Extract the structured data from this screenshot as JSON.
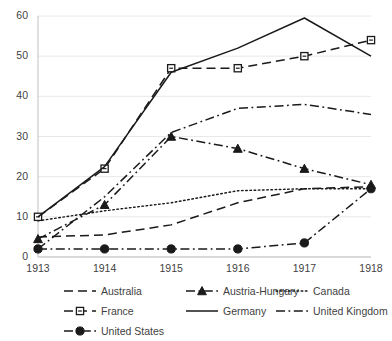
{
  "chart_data": {
    "type": "line",
    "title": "",
    "xlabel": "",
    "ylabel": "",
    "x": [
      1913,
      1914,
      1915,
      1916,
      1917,
      1918
    ],
    "xtick_labels": [
      "1913",
      "1914",
      "1915",
      "1916",
      "1917",
      "1918"
    ],
    "ytick_labels": [
      "0",
      "10",
      "20",
      "30",
      "40",
      "50",
      "60"
    ],
    "ylim": [
      0,
      60
    ],
    "ytick_step": 10,
    "grid": "horizontal",
    "legend_position": "bottom",
    "series": [
      {
        "name": "Australia",
        "values": [
          5,
          5.5,
          8,
          13.5,
          17,
          17.5
        ],
        "style": "dashed",
        "marker": "none",
        "color": "#1a1a1a"
      },
      {
        "name": "Austria-Hungary",
        "values": [
          4.5,
          13,
          30,
          27,
          22,
          18
        ],
        "style": "dash-dot",
        "marker": "triangle",
        "color": "#1a1a1a"
      },
      {
        "name": "Canada",
        "values": [
          9,
          11.5,
          13.5,
          16.5,
          17,
          17
        ],
        "style": "dotted",
        "marker": "none",
        "color": "#1a1a1a"
      },
      {
        "name": "France",
        "values": [
          10,
          22,
          47,
          47,
          50,
          54
        ],
        "style": "dashed",
        "marker": "square",
        "color": "#1a1a1a"
      },
      {
        "name": "Germany",
        "values": [
          10,
          22.5,
          46,
          52,
          59.5,
          50
        ],
        "style": "solid",
        "marker": "none",
        "color": "#1a1a1a"
      },
      {
        "name": "United Kingdom",
        "values": [
          2,
          15,
          31,
          37,
          38,
          35.5
        ],
        "style": "dash-dot",
        "marker": "none",
        "color": "#1a1a1a"
      },
      {
        "name": "United States",
        "values": [
          2,
          2,
          2,
          2,
          3.5,
          17
        ],
        "style": "dash-dot",
        "marker": "circle",
        "color": "#1a1a1a"
      }
    ]
  },
  "legend": {
    "items": [
      {
        "label": "Australia"
      },
      {
        "label": "Austria-Hungary"
      },
      {
        "label": "Canada"
      },
      {
        "label": "France"
      },
      {
        "label": "Germany"
      },
      {
        "label": "United Kingdom"
      },
      {
        "label": "United States"
      }
    ]
  },
  "axes": {
    "gridline_color": "#e8e8e8",
    "axis_color": "#bfbfbf",
    "label_color": "#3f3f3f"
  }
}
